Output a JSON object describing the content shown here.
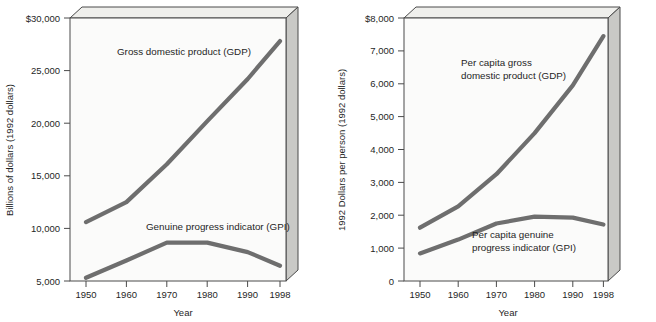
{
  "figure": {
    "title": "",
    "panels": [
      "left",
      "right"
    ]
  },
  "left": {
    "ylabel": "Billions of dollars (1992 dollars)",
    "xlabel": "Year",
    "ytick_labels": [
      "$30,000",
      "25,000",
      "20,000",
      "15,000",
      "10,000",
      "5,000"
    ],
    "xtick_labels": [
      "1950",
      "1960",
      "1970",
      "1980",
      "1990",
      "1998"
    ],
    "label_gdp": "Gross domestic product (GDP)",
    "label_gpi": "Genuine progress indicator (GPI)"
  },
  "right": {
    "ylabel": "1992 Dollars per person (1992 dollars)",
    "xlabel": "Year",
    "ytick_labels": [
      "$8,000",
      "7,000",
      "6,000",
      "5,000",
      "4,000",
      "3,000",
      "2,000",
      "1,000",
      "0"
    ],
    "xtick_labels": [
      "1950",
      "1960",
      "1970",
      "1980",
      "1990",
      "1998"
    ],
    "label_gdp_line1": "Per capita gross",
    "label_gdp_line2": "domestic product (GDP)",
    "label_gpi_line1": "Per capita genuine",
    "label_gpi_line2": "progress indicator (GPI)"
  },
  "colors": {
    "series": "#6e6e6e",
    "axis": "#4a4a4a",
    "plot_face": "#fbfbfa",
    "side_face": "#c9c9c6",
    "top_face": "#efefec",
    "text": "#1f1f1f"
  },
  "chart_data": [
    {
      "type": "line",
      "title": "",
      "xlabel": "Year",
      "ylabel": "Billions of dollars (1992 dollars)",
      "x": [
        1950,
        1960,
        1970,
        1980,
        1990,
        1998
      ],
      "xtick_labels": [
        "1950",
        "1960",
        "1970",
        "1980",
        "1990",
        "1998"
      ],
      "ytick_values": [
        5000,
        10000,
        15000,
        20000,
        25000,
        30000
      ],
      "ytick_labels": [
        "5,000",
        "10,000",
        "15,000",
        "20,000",
        "25,000",
        "$30,000"
      ],
      "xlim": [
        1950,
        1998
      ],
      "ylim": [
        5000,
        30000
      ],
      "grid": false,
      "legend": "inline-annotations",
      "series": [
        {
          "name": "Gross domestic product (GDP)",
          "values": [
            10600,
            12500,
            16100,
            20200,
            24200,
            27800
          ]
        },
        {
          "name": "Genuine progress indicator (GPI)",
          "values": [
            5300,
            6950,
            8650,
            8650,
            7750,
            6450
          ]
        }
      ]
    },
    {
      "type": "line",
      "title": "",
      "xlabel": "Year",
      "ylabel": "1992 Dollars per person (1992 dollars)",
      "x": [
        1950,
        1960,
        1970,
        1980,
        1990,
        1998
      ],
      "xtick_labels": [
        "1950",
        "1960",
        "1970",
        "1980",
        "1990",
        "1998"
      ],
      "ytick_values": [
        0,
        1000,
        2000,
        3000,
        4000,
        5000,
        6000,
        7000,
        8000
      ],
      "ytick_labels": [
        "0",
        "1,000",
        "2,000",
        "3,000",
        "4,000",
        "5,000",
        "6,000",
        "7,000",
        "$8,000"
      ],
      "xlim": [
        1950,
        1998
      ],
      "ylim": [
        0,
        8000
      ],
      "grid": false,
      "legend": "inline-annotations",
      "series": [
        {
          "name": "Per capita gross domestic product (GDP)",
          "values": [
            1620,
            2270,
            3250,
            4500,
            5950,
            7450
          ]
        },
        {
          "name": "Per capita genuine progress indicator (GPI)",
          "values": [
            840,
            1260,
            1750,
            1960,
            1930,
            1720
          ]
        }
      ]
    }
  ]
}
